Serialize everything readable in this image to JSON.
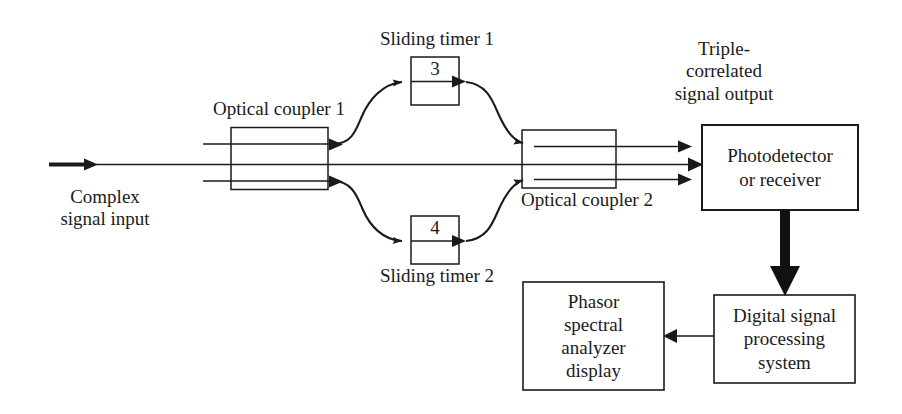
{
  "figure": {
    "stroke_color": "#1a1a1a",
    "background_color": "#ffffff"
  },
  "labels": {
    "complex_signal_input": "Complex\nsignal input",
    "optical_coupler_1": "Optical coupler 1",
    "optical_coupler_2": "Optical coupler 2",
    "sliding_timer_1": "Sliding timer 1",
    "sliding_timer_2": "Sliding timer 2",
    "triple_correlated_output": "Triple-\ncorrelated\nsignal output"
  },
  "blocks": {
    "timer_1_value": "3",
    "timer_2_value": "4",
    "photodetector": "Photodetector\nor receiver",
    "digital_signal_processing": "Digital signal\nprocessing\nsystem",
    "phasor_display": "Phasor\nspectral\nanalyzer\ndisplay"
  },
  "icons": {
    "arrow_input": "arrow-right-icon",
    "arrow_output_top": "arrow-right-icon",
    "arrow_output_bottom": "arrow-right-icon",
    "arrow_to_detector": "arrow-right-icon",
    "arrow_detector_to_dsp": "arrow-down-icon",
    "arrow_dsp_to_display": "arrow-left-icon"
  }
}
